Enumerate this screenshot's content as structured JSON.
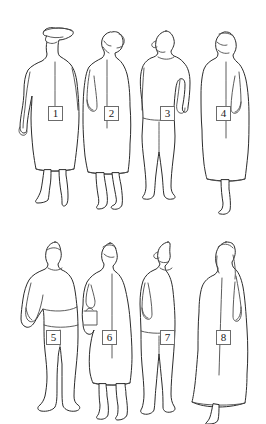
{
  "canvas": {
    "width": 266,
    "height": 424,
    "background_color": "#ffffff",
    "line_color": "#2b2b2b",
    "detail_line_color": "#4a4a4a",
    "badge_border_color": "#6b6b6b",
    "badge_text_color": "#1a1a1a",
    "style": "line-art outline drawing, black on white, no fill"
  },
  "illustration": {
    "kind": "figure-silhouette-sheet",
    "rows": 2,
    "columns": 4,
    "figure_count": 8
  },
  "figures": [
    {
      "number": "1",
      "name": "figure-1",
      "row": 1,
      "column": 1,
      "description": "standing figure wearing a brimmed hat and a long coat, arms hanging at sides, legs visible below coat hem",
      "badge": {
        "label": "1",
        "x": 48,
        "y": 106,
        "width": 15,
        "height": 15
      }
    },
    {
      "number": "2",
      "name": "figure-2",
      "row": 1,
      "column": 2,
      "description": "standing figure with tied-back hair in a long coat or dress, near arm bent with hand at hip, legs visible below hem",
      "badge": {
        "label": "2",
        "x": 104,
        "y": 106,
        "width": 15,
        "height": 15
      }
    },
    {
      "number": "3",
      "name": "figure-3",
      "row": 1,
      "column": 3,
      "description": "standing man in shirt and trousers, far arm bent with hand on hip forming a triangular gap, feet apart",
      "badge": {
        "label": "3",
        "x": 160,
        "y": 106,
        "width": 15,
        "height": 15
      }
    },
    {
      "number": "4",
      "name": "figure-4",
      "row": 1,
      "column": 4,
      "description": "standing figure in a long coat or dress, far arm bent at side, one leg and foot visible below hem",
      "badge": {
        "label": "4",
        "x": 216,
        "y": 106,
        "width": 15,
        "height": 15
      }
    },
    {
      "number": "5",
      "name": "figure-5",
      "row": 2,
      "column": 1,
      "description": "standing man in shirt and trousers, near arm bent with hand on hip, feet planted apart",
      "badge": {
        "label": "5",
        "x": 46,
        "y": 330,
        "width": 15,
        "height": 15
      }
    },
    {
      "number": "6",
      "name": "figure-6",
      "row": 2,
      "column": 2,
      "description": "standing figure in a knee-length tunic or dress, arm bent forward holding an object at the waist, legs visible below hem",
      "badge": {
        "label": "6",
        "x": 102,
        "y": 330,
        "width": 15,
        "height": 15
      }
    },
    {
      "number": "7",
      "name": "figure-7",
      "row": 2,
      "column": 3,
      "description": "standing man seen in three-quarter profile, near arm bent with hand on hip, long trousers, foot turned forward",
      "badge": {
        "label": "7",
        "x": 160,
        "y": 330,
        "width": 15,
        "height": 15
      }
    },
    {
      "number": "8",
      "name": "figure-8",
      "row": 2,
      "column": 4,
      "description": "standing woman with long hair in a full-length dress flaring to the hem, arm at side, one foot visible",
      "badge": {
        "label": "8",
        "x": 216,
        "y": 330,
        "width": 15,
        "height": 15
      }
    }
  ]
}
